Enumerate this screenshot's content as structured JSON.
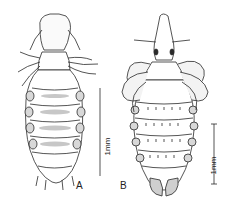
{
  "figure": {
    "panels": [
      {
        "id": "A",
        "label": "A",
        "scale_label": "1mm",
        "subject": "louse-specimen-a"
      },
      {
        "id": "B",
        "label": "B",
        "scale_label": "1mm",
        "subject": "louse-specimen-b"
      }
    ],
    "colors": {
      "ink": "#2a2a2a",
      "background": "#ffffff",
      "shade": "#9a9a9a"
    }
  }
}
